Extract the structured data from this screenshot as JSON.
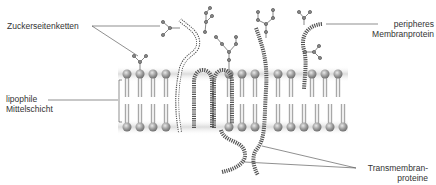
{
  "labels": {
    "sugar_chains": "Zuckerseitenketten",
    "peripheral_protein_line1": "peripheres",
    "peripheral_protein_line2": "Membranprotein",
    "lipophilic_line1": "lipophile",
    "lipophilic_line2": "Mittelschicht",
    "transmembrane_line1": "Transmembran-",
    "transmembrane_line2": "proteine"
  },
  "colors": {
    "lipid_head": "#9a9a9a",
    "lipid_tail": "#a8a8a8",
    "protein_coil": "#555555",
    "leader_line": "#444444",
    "membrane_shadow": "#e6e6e6"
  },
  "membrane": {
    "top_heads_x": [
      127,
      140,
      153,
      166,
      229,
      242,
      255,
      278,
      291,
      312,
      325
    ],
    "bottom_heads_x": [
      127,
      140,
      153,
      166,
      229,
      242,
      255,
      278,
      291,
      312,
      325,
      338
    ],
    "top_y": 74,
    "bottom_y": 127
  }
}
